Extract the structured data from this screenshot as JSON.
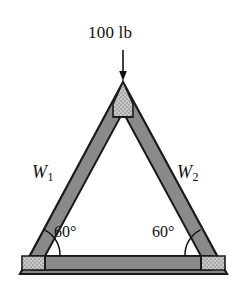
{
  "figure": {
    "type": "statics-truss-diagram",
    "background_color": "#ffffff",
    "outline_color": "#1a1a1a",
    "member_fill_color": "#8a8a8a",
    "gusset_fill_color": "#c2c2c2",
    "load": {
      "label": "100 lb",
      "direction": "down",
      "arrow_name": "load-arrow",
      "applied_at": "apex"
    },
    "members": [
      {
        "id": "W1",
        "label": "W",
        "subscript": "1",
        "side": "left"
      },
      {
        "id": "W2",
        "label": "W",
        "subscript": "2",
        "side": "right"
      }
    ],
    "angles": [
      {
        "id": "angle-left",
        "label": "60°",
        "vertex": "bottom-left"
      },
      {
        "id": "angle-right",
        "label": "60°",
        "vertex": "bottom-right"
      }
    ],
    "geometry": {
      "apex": [
        123,
        82
      ],
      "bottom_left": [
        20,
        274
      ],
      "bottom_right": [
        227,
        274
      ],
      "member_thickness_px": 14,
      "base_bar_top_y": 256,
      "base_bar_bottom_y": 270
    }
  }
}
